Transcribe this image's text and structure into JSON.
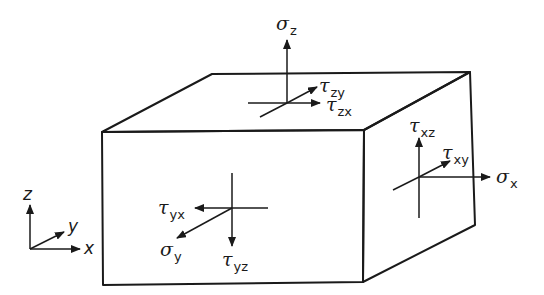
{
  "diagram": {
    "colors": {
      "line": "#1a1a1a",
      "background": "#ffffff"
    },
    "top_face": {
      "sigma_z": {
        "symbol": "σ",
        "sub": "z"
      },
      "tau_zy": {
        "symbol": "τ",
        "sub": "zy"
      },
      "tau_zx": {
        "symbol": "τ",
        "sub": "zx"
      }
    },
    "right_face": {
      "tau_xz": {
        "symbol": "τ",
        "sub": "xz"
      },
      "tau_xy": {
        "symbol": "τ",
        "sub": "xy"
      },
      "sigma_x": {
        "symbol": "σ",
        "sub": "x"
      }
    },
    "front_face": {
      "tau_yx": {
        "symbol": "τ",
        "sub": "yx"
      },
      "sigma_y": {
        "symbol": "σ",
        "sub": "y"
      },
      "tau_yz": {
        "symbol": "τ",
        "sub": "yz"
      }
    },
    "axes": {
      "z": "z",
      "y": "y",
      "x": "x"
    }
  }
}
